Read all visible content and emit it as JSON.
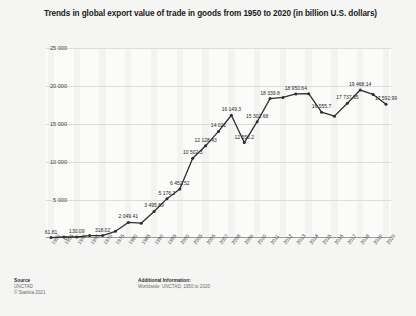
{
  "chart_data": {
    "type": "line",
    "title": "Trends in global export value of trade in goods from 1950 to 2020 (in billion U.S. dollars)",
    "xlabel": "",
    "ylabel": "Export value in billion U.S. dollars",
    "ylim": [
      0,
      25000
    ],
    "yticks": [
      "0",
      "5 000",
      "10 000",
      "15 000",
      "20 000",
      "25 000"
    ],
    "ytick_values": [
      0,
      5000,
      10000,
      15000,
      20000,
      25000
    ],
    "grid": true,
    "legend": "none",
    "categories": [
      "1950",
      "1955",
      "1960",
      "1965",
      "1970",
      "1975",
      "1980",
      "1985",
      "1990",
      "1995",
      "2000",
      "2005",
      "2006",
      "2007",
      "2008",
      "2009",
      "2010",
      "2011",
      "2012",
      "2013",
      "2014",
      "2015",
      "2016",
      "2017",
      "2018",
      "2019",
      "2020"
    ],
    "values": [
      61.81,
      130.09,
      130.09,
      318.02,
      318.02,
      877,
      2049.41,
      1954,
      3495.69,
      5176.2,
      6452.52,
      10502.3,
      12128.43,
      14021,
      16149.3,
      12556.2,
      15302.68,
      18339.8,
      18496,
      18950.64,
      18995,
      16555.7,
      16035,
      17737.95,
      19468.14,
      18888,
      17592.99
    ],
    "labels": [
      {
        "category": "1950",
        "text": "61.81"
      },
      {
        "category": "1960",
        "text": "130.09"
      },
      {
        "category": "1970",
        "text": "318.02"
      },
      {
        "category": "1980",
        "text": "2 049.41"
      },
      {
        "category": "1990",
        "text": "3 495.69"
      },
      {
        "category": "1995",
        "text": "5 176.2"
      },
      {
        "category": "2000",
        "text": "6 452.52"
      },
      {
        "category": "2005",
        "text": "10 502.3"
      },
      {
        "category": "2006",
        "text": "12 128.43"
      },
      {
        "category": "2007",
        "text": "14 021"
      },
      {
        "category": "2008",
        "text": "16 149.3"
      },
      {
        "category": "2009",
        "text": "12 556.2"
      },
      {
        "category": "2010",
        "text": "15 302.68"
      },
      {
        "category": "2011",
        "text": "18 339.8"
      },
      {
        "category": "2013",
        "text": "18 950.64"
      },
      {
        "category": "2015",
        "text": "16 555.7"
      },
      {
        "category": "2017",
        "text": "17 737.95"
      },
      {
        "category": "2018",
        "text": "19 468.14"
      },
      {
        "category": "2020",
        "text": "17 592.99"
      }
    ],
    "series_color": "#2e2e2e"
  },
  "footer": {
    "source_head": "Source",
    "source_line1": "UNCTAD",
    "source_line2": "© Statista 2021",
    "additional_head": "Additional Information:",
    "additional_line1": "Worldwide; UNCTAD; 1950 to 2020"
  }
}
